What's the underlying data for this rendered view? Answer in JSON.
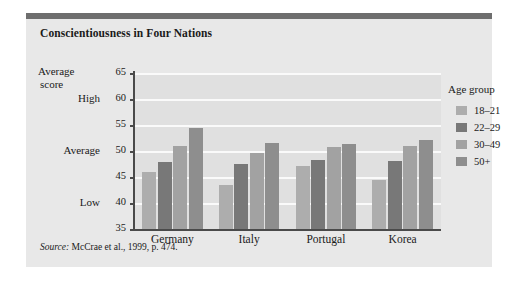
{
  "figure": {
    "title": "Conscientiousness in Four Nations",
    "source_prefix": "Source:",
    "source_text": "McCrae et al., 1999, p. 474.",
    "background_color": "#e8e8e8",
    "plot_background_color": "#e0e0e0",
    "top_rule_color": "#6e6e6e",
    "gridline_color": "#fafafa",
    "axis_color": "#4a4a4a"
  },
  "legend": {
    "title": "Age group",
    "position": "right",
    "entries": [
      {
        "label": "18–21",
        "color": "#adadad"
      },
      {
        "label": "22–29",
        "color": "#787878"
      },
      {
        "label": "30–49",
        "color": "#a2a2a2"
      },
      {
        "label": "50+",
        "color": "#8e8e8e"
      }
    ]
  },
  "axes": {
    "y_title_line1": "Average",
    "y_title_line2": "score",
    "y_ticks": [
      "65",
      "60",
      "55",
      "50",
      "45",
      "40",
      "35"
    ],
    "y_word_labels": [
      {
        "value": 60,
        "text": "High"
      },
      {
        "value": 50,
        "text": "Average"
      },
      {
        "value": 40,
        "text": "Low"
      }
    ],
    "y_min": 35,
    "y_max": 65,
    "x_ticks": [
      "Germany",
      "Italy",
      "Portugal",
      "Korea"
    ]
  },
  "chart_data": {
    "type": "bar",
    "title": "Conscientiousness in Four Nations",
    "xlabel": "",
    "ylabel": "Average score",
    "ylim": [
      35,
      65
    ],
    "ytick_step": 5,
    "grid": true,
    "legend_position": "right",
    "legend_title": "Age group",
    "categories": [
      "Germany",
      "Italy",
      "Portugal",
      "Korea"
    ],
    "series": [
      {
        "name": "18–21",
        "color": "#adadad",
        "values": [
          46.0,
          43.5,
          47.2,
          44.5
        ]
      },
      {
        "name": "22–29",
        "color": "#787878",
        "values": [
          47.9,
          47.5,
          48.3,
          48.0
        ]
      },
      {
        "name": "30–49",
        "color": "#a2a2a2",
        "values": [
          50.9,
          49.6,
          50.8,
          50.9
        ]
      },
      {
        "name": "50+",
        "color": "#8e8e8e",
        "values": [
          54.5,
          51.6,
          51.4,
          52.1
        ]
      }
    ],
    "annotations": [
      {
        "at_y": 60,
        "text": "High"
      },
      {
        "at_y": 50,
        "text": "Average"
      },
      {
        "at_y": 40,
        "text": "Low"
      }
    ],
    "source": "Source: McCrae et al., 1999, p. 474."
  }
}
